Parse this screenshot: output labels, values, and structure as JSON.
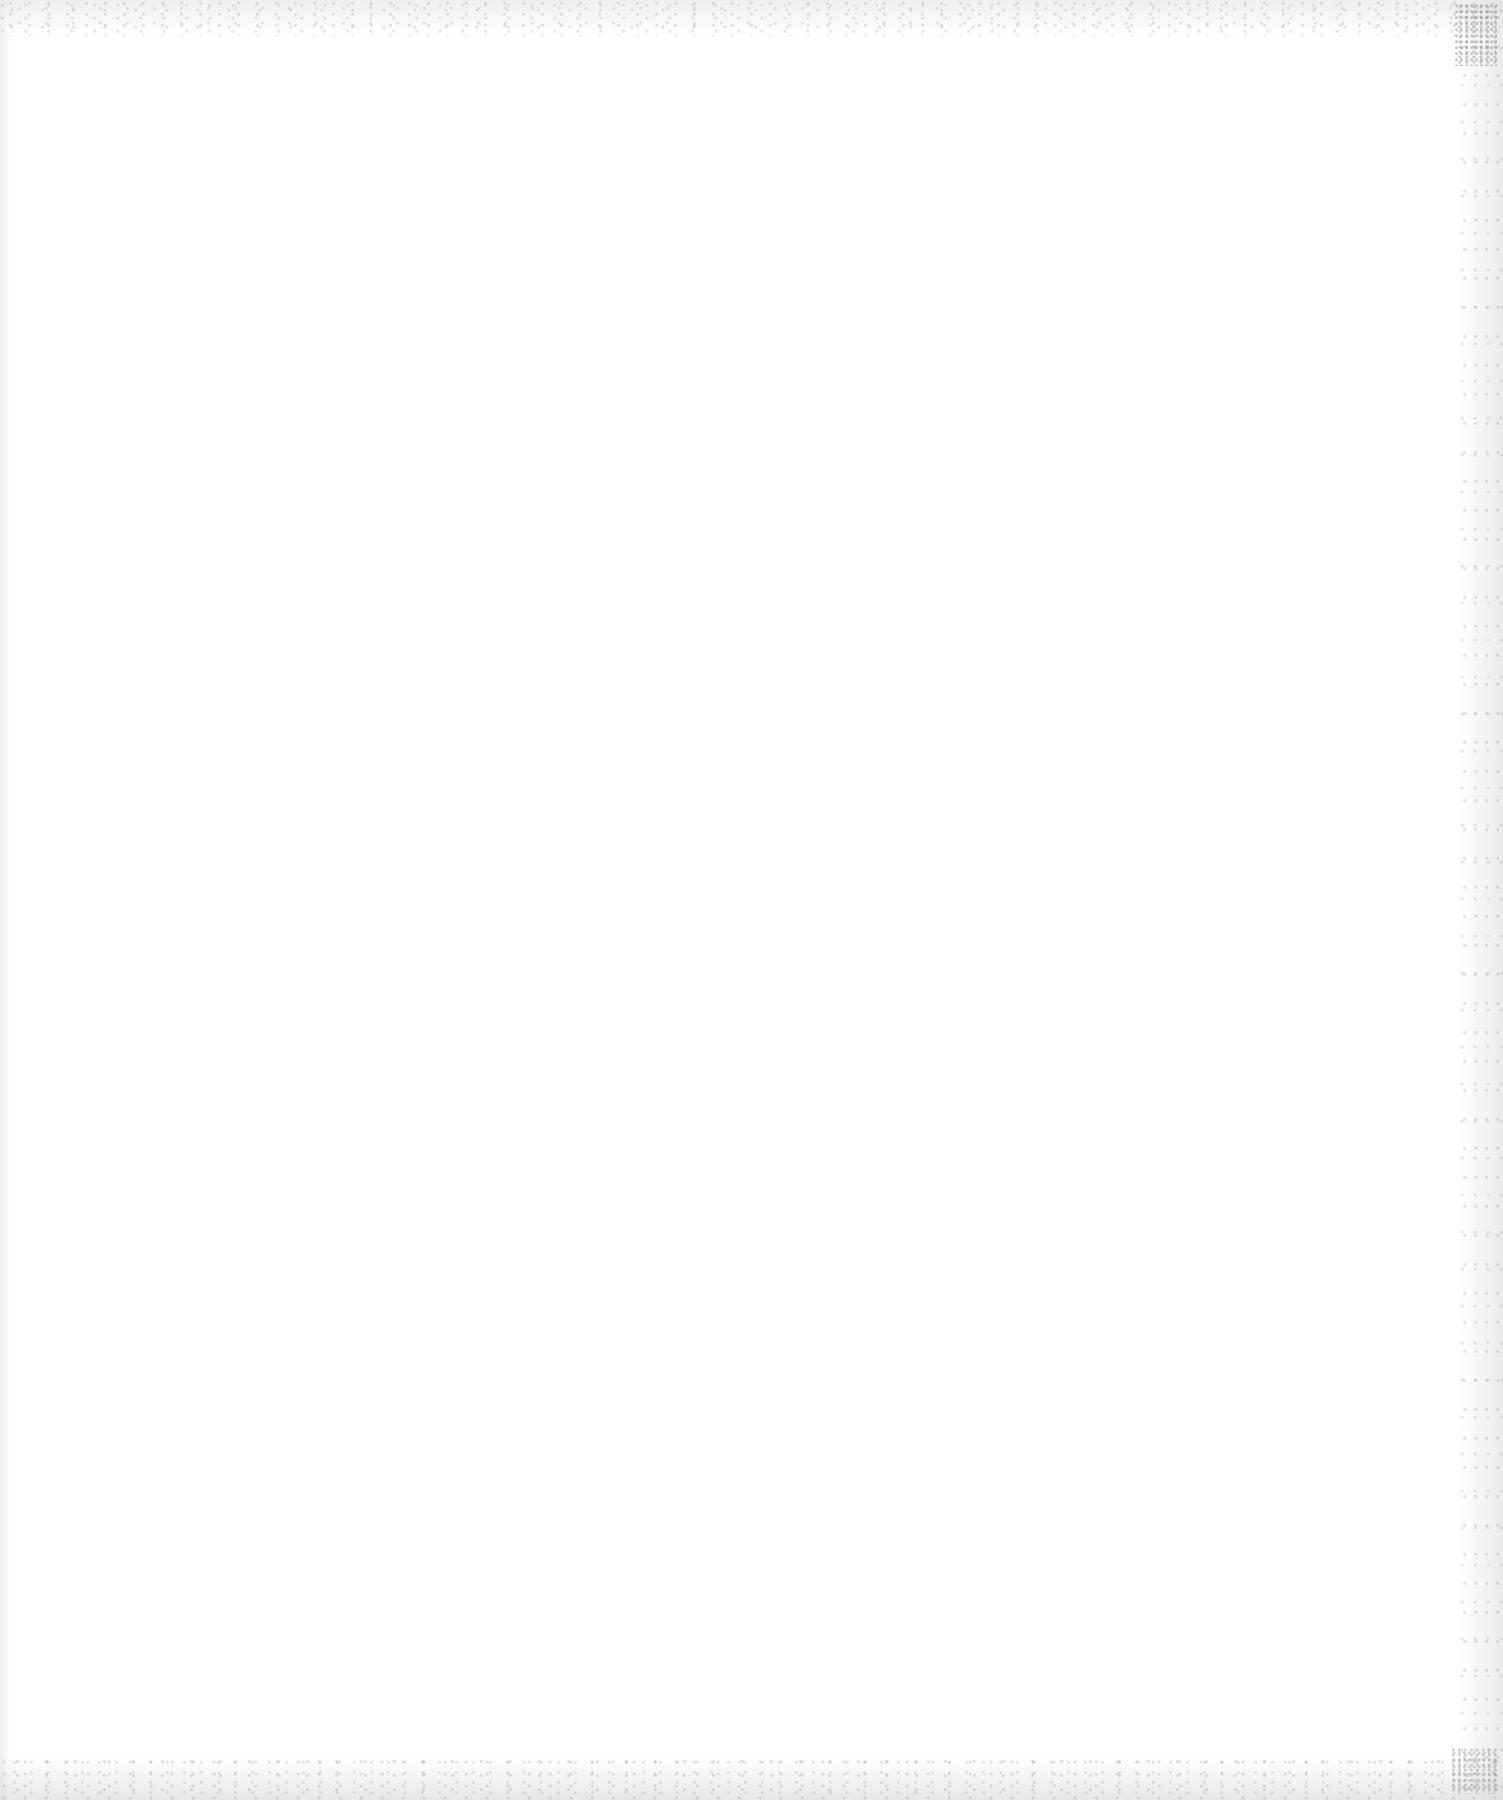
{
  "document": {
    "type": "blank-scanned-page",
    "text_content": [],
    "background_color": "#ffffff"
  }
}
